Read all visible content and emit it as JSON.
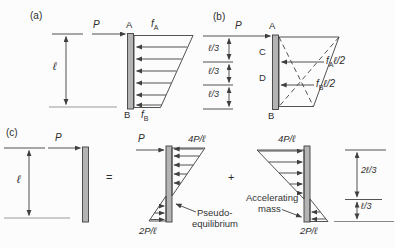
{
  "panels": {
    "a": {
      "tag": "(a)",
      "length_label": "ℓ",
      "force_label": "P",
      "node_top": "A",
      "node_bottom": "B",
      "intensity_top": {
        "base": "f",
        "sub": "A"
      },
      "intensity_bottom": {
        "base": "f",
        "sub": "B"
      }
    },
    "b": {
      "tag": "(b)",
      "force_label": "P",
      "node_top": "A",
      "node_upper_third": "C",
      "node_lower_third": "D",
      "node_bottom": "B",
      "dim_segments": [
        "ℓ/3",
        "ℓ/3",
        "ℓ/3"
      ],
      "resultant_top": {
        "base": "f",
        "sub": "A",
        "tail": "ℓ/2"
      },
      "resultant_bottom": {
        "base": "f",
        "sub": "B",
        "tail": "ℓ/2"
      }
    },
    "c": {
      "tag": "(c)",
      "force_label": "P",
      "length_label": "ℓ",
      "equals_sign": "=",
      "plus_sign": "+",
      "pseudo": {
        "force_label": "P",
        "top_intensity": "4P/ℓ",
        "bottom_intensity": "2P/ℓ",
        "caption_line1": "Pseudo-",
        "caption_line2": "equilibrium"
      },
      "inertia": {
        "top_intensity": "4P/ℓ",
        "bottom_intensity": "2P/ℓ",
        "caption_line1": "Accelerating",
        "caption_line2": "mass",
        "dim_upper": "2ℓ/3",
        "dim_lower": "ℓ/3"
      }
    }
  },
  "colors": {
    "ink": "#3f3f3f",
    "bar_fill": "#b4b4b4",
    "baseline_gray": "#909090",
    "background": "#fcfcfc"
  }
}
